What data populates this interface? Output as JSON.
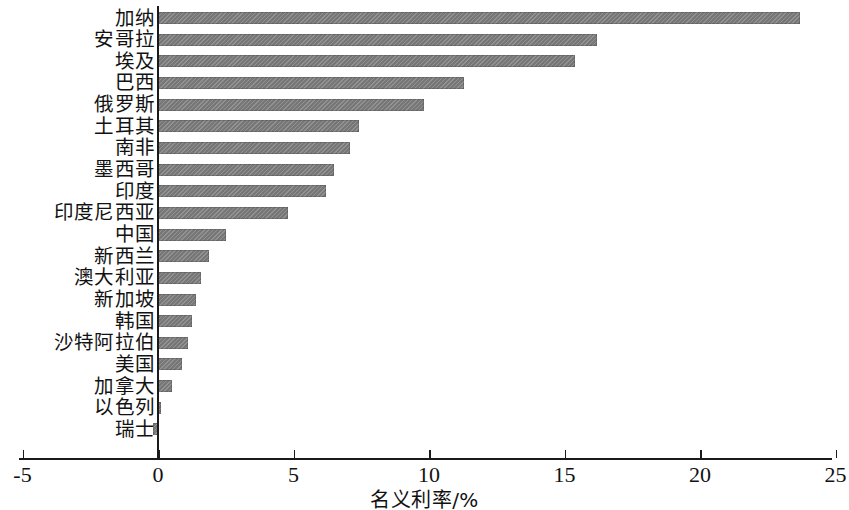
{
  "chart_data": {
    "type": "bar",
    "orientation": "horizontal",
    "title": "",
    "xlabel": "名义利率/%",
    "ylabel": "",
    "xlim": [
      -5,
      25
    ],
    "xticks": [
      -5,
      0,
      5,
      10,
      15,
      20,
      25
    ],
    "xticklabels": [
      "-5",
      "0",
      "5",
      "10",
      "15",
      "20",
      "25"
    ],
    "grid": false,
    "legend": null,
    "bar_color": "#777777",
    "axis_color": "#1a1a1a",
    "categories": [
      "加纳",
      "安哥拉",
      "埃及",
      "巴西",
      "俄罗斯",
      "土耳其",
      "南非",
      "墨西哥",
      "印度",
      "印度尼西亚",
      "中国",
      "新西兰",
      "澳大利亚",
      "新加坡",
      "韩国",
      "沙特阿拉伯",
      "美国",
      "加拿大",
      "以色列",
      "瑞士"
    ],
    "values": [
      23.7,
      16.2,
      15.4,
      11.3,
      9.8,
      7.4,
      7.1,
      6.5,
      6.2,
      4.8,
      2.5,
      1.9,
      1.6,
      1.4,
      1.25,
      1.1,
      0.9,
      0.5,
      0.1,
      -0.2
    ]
  }
}
